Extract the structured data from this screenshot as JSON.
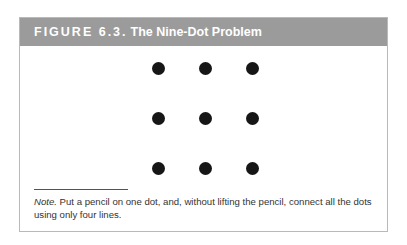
{
  "figure": {
    "label": "FIGURE 6.3.",
    "name": "The Nine-Dot Problem",
    "header_color": "#9b9b9b",
    "title_color": "#ffffff"
  },
  "dots": {
    "rows": 3,
    "columns": 3,
    "color": "#161616",
    "positions": [
      {
        "x": 157,
        "y": 67
      },
      {
        "x": 204,
        "y": 67
      },
      {
        "x": 251,
        "y": 67
      },
      {
        "x": 157,
        "y": 117
      },
      {
        "x": 204,
        "y": 117
      },
      {
        "x": 251,
        "y": 117
      },
      {
        "x": 157,
        "y": 167
      },
      {
        "x": 204,
        "y": 167
      },
      {
        "x": 251,
        "y": 167
      }
    ]
  },
  "note": {
    "label": "Note.",
    "text": " Put a pencil on one dot, and, without lifting the pencil, connect all the dots using only four lines."
  }
}
